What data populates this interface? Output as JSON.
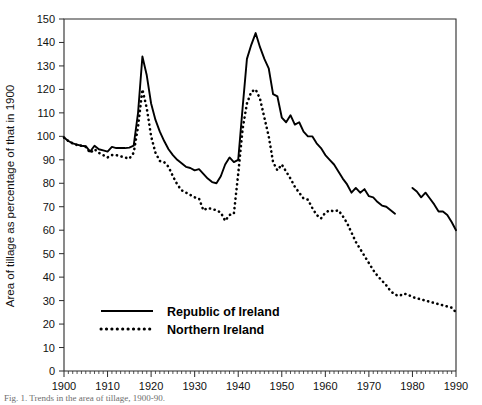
{
  "figure": {
    "caption": "Fig. 1. Trends in the area of tillage, 1900-90.",
    "background_color": "#ffffff",
    "ink_color": "#000000"
  },
  "chart_data": {
    "type": "line",
    "title": "",
    "subtitle": "",
    "xlabel": "",
    "ylabel": "Area of tillage as percentage of that in 1900",
    "xlim": [
      1900,
      1990
    ],
    "ylim": [
      0,
      150
    ],
    "grid": false,
    "x_ticks": [
      1900,
      1910,
      1920,
      1930,
      1940,
      1950,
      1960,
      1970,
      1980,
      1990
    ],
    "x_tick_labels": [
      "1900",
      "1910",
      "1920",
      "1930",
      "1940",
      "1950",
      "1960",
      "1970",
      "1980",
      "1990"
    ],
    "x_minor_tick_step": 1,
    "y_ticks": [
      0,
      10,
      20,
      30,
      40,
      50,
      60,
      70,
      80,
      90,
      100,
      110,
      120,
      130,
      140,
      150
    ],
    "y_tick_labels": [
      "0",
      "10",
      "20",
      "30",
      "40",
      "50",
      "60",
      "70",
      "80",
      "90",
      "100",
      "110",
      "120",
      "130",
      "140",
      "150"
    ],
    "legend_position": "inside-lower-left",
    "legend_entries": [
      {
        "label": "Republic of Ireland",
        "style": "solid",
        "color": "#000000"
      },
      {
        "label": "Northern Ireland",
        "style": "dotted",
        "color": "#000000"
      }
    ],
    "series": [
      {
        "name": "Republic of Ireland",
        "style": "solid",
        "color": "#000000",
        "x": [
          1900,
          1901,
          1902,
          1903,
          1904,
          1905,
          1906,
          1907,
          1908,
          1909,
          1910,
          1911,
          1912,
          1913,
          1914,
          1915,
          1916,
          1917,
          1918,
          1919,
          1920,
          1921,
          1922,
          1923,
          1924,
          1925,
          1926,
          1927,
          1928,
          1929,
          1930,
          1931,
          1932,
          1933,
          1934,
          1935,
          1936,
          1937,
          1938,
          1939,
          1940,
          1941,
          1942,
          1943,
          1944,
          1945,
          1946,
          1947,
          1948,
          1949,
          1950,
          1951,
          1952,
          1953,
          1954,
          1955,
          1956,
          1957,
          1958,
          1959,
          1960,
          1961,
          1962,
          1963,
          1964,
          1965,
          1966,
          1967,
          1968,
          1969,
          1970,
          1971,
          1972,
          1973,
          1974,
          1975,
          1976,
          1980,
          1981,
          1982,
          1983,
          1984,
          1985,
          1986,
          1987,
          1988,
          1989,
          1990
        ],
        "values": [
          99.5,
          98.0,
          97.0,
          96.5,
          96.0,
          95.8,
          93.5,
          96.0,
          94.5,
          94.0,
          93.5,
          95.5,
          95.0,
          95.0,
          95.0,
          95.2,
          96.0,
          110.0,
          134.0,
          126.0,
          114.0,
          107.0,
          102.0,
          98.0,
          94.5,
          92.0,
          90.0,
          88.5,
          87.0,
          86.5,
          85.5,
          86.0,
          84.0,
          82.0,
          80.5,
          80.0,
          83.0,
          88.0,
          91.0,
          89.0,
          90.0,
          112.0,
          133.0,
          139.0,
          144.0,
          138.0,
          133.0,
          129.0,
          118.0,
          117.0,
          108.0,
          106.0,
          109.0,
          105.0,
          106.0,
          102.0,
          100.0,
          100.0,
          97.0,
          95.0,
          92.0,
          90.0,
          88.0,
          85.0,
          82.0,
          79.5,
          76.0,
          78.0,
          76.0,
          77.5,
          74.5,
          74.0,
          72.0,
          70.5,
          70.0,
          68.5,
          67.0,
          78.0,
          76.5,
          74.0,
          76.0,
          73.5,
          71.0,
          68.0,
          68.0,
          66.5,
          63.5,
          60.0
        ],
        "gaps": [
          [
            1976,
            1980
          ]
        ]
      },
      {
        "name": "Northern Ireland",
        "style": "dotted",
        "color": "#000000",
        "x": [
          1900,
          1901,
          1902,
          1903,
          1904,
          1905,
          1906,
          1907,
          1908,
          1909,
          1910,
          1911,
          1912,
          1913,
          1914,
          1915,
          1916,
          1917,
          1918,
          1919,
          1920,
          1921,
          1922,
          1923,
          1924,
          1925,
          1926,
          1927,
          1928,
          1929,
          1930,
          1931,
          1932,
          1933,
          1934,
          1935,
          1936,
          1937,
          1938,
          1939,
          1940,
          1941,
          1942,
          1943,
          1944,
          1945,
          1946,
          1947,
          1948,
          1949,
          1950,
          1951,
          1952,
          1953,
          1954,
          1955,
          1956,
          1957,
          1958,
          1959,
          1960,
          1961,
          1962,
          1963,
          1964,
          1965,
          1966,
          1967,
          1968,
          1969,
          1970,
          1971,
          1972,
          1973,
          1974,
          1975,
          1976,
          1977,
          1978,
          1979,
          1980,
          1981,
          1982,
          1983,
          1984,
          1985,
          1986,
          1987,
          1988,
          1989,
          1990
        ],
        "values": [
          99.5,
          98.0,
          97.0,
          96.3,
          96.0,
          95.5,
          93.0,
          94.5,
          93.0,
          92.0,
          91.0,
          92.0,
          92.0,
          91.5,
          91.0,
          90.5,
          93.0,
          104.0,
          120.0,
          112.0,
          100.0,
          93.0,
          89.5,
          89.0,
          87.0,
          83.0,
          79.5,
          77.0,
          76.0,
          75.0,
          74.0,
          73.5,
          68.5,
          69.5,
          69.0,
          68.5,
          67.5,
          64.0,
          66.5,
          67.0,
          84.0,
          103.0,
          114.0,
          119.0,
          120.0,
          116.0,
          108.0,
          100.0,
          89.0,
          85.5,
          88.0,
          85.0,
          82.0,
          78.5,
          76.0,
          73.5,
          73.0,
          69.5,
          66.5,
          65.0,
          67.5,
          68.5,
          68.0,
          68.5,
          66.0,
          63.0,
          59.0,
          55.0,
          52.0,
          49.0,
          46.0,
          43.0,
          40.5,
          38.5,
          36.5,
          34.0,
          32.5,
          32.0,
          33.0,
          32.5,
          31.5,
          31.0,
          30.5,
          30.0,
          29.5,
          29.0,
          28.5,
          28.0,
          27.5,
          27.0,
          25.0
        ],
        "gaps": []
      }
    ]
  }
}
